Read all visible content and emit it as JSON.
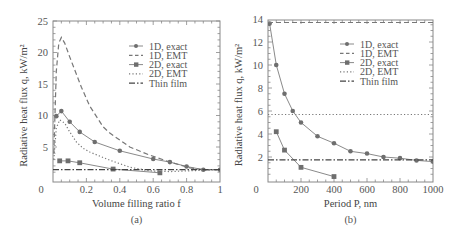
{
  "chart_data": [
    {
      "type": "line",
      "panel": "(a)",
      "title": "",
      "xlabel": "Volume filling ratio f",
      "ylabel": "Radiative heat flux q, kW/m²",
      "xlim": [
        0,
        1
      ],
      "ylim": [
        0,
        25
      ],
      "xticks": [
        0,
        0.2,
        0.4,
        0.6,
        0.8,
        1
      ],
      "xtick_labels": [
        "0",
        "0.2",
        "0.4",
        "0.6",
        "0.8",
        "1"
      ],
      "yticks": [
        5,
        10,
        15,
        20,
        25
      ],
      "ytick_labels": [
        "5",
        "10",
        "15",
        "20",
        "25"
      ],
      "grid": false,
      "legend_position": "upper right",
      "series": [
        {
          "name": "1D, exact",
          "style": "solid-circle",
          "x": [
            0.02,
            0.05,
            0.1,
            0.16,
            0.25,
            0.4,
            0.6,
            0.7,
            0.8,
            0.9,
            1.0
          ],
          "y": [
            9.9,
            10.7,
            9.0,
            7.4,
            5.8,
            4.4,
            3.1,
            2.6,
            1.9,
            1.4,
            1.4
          ]
        },
        {
          "name": "1D, EMT",
          "style": "dashed",
          "x": [
            0.005,
            0.02,
            0.035,
            0.05,
            0.07,
            0.1,
            0.17,
            0.22,
            0.3,
            0.34,
            0.46,
            0.58,
            0.7,
            0.82,
            0.9,
            1.0
          ],
          "y": [
            4,
            17,
            21.5,
            22.4,
            21.5,
            19.3,
            14.5,
            11.5,
            8.2,
            7.2,
            5.0,
            3.7,
            2.6,
            1.7,
            1.4,
            1.4
          ]
        },
        {
          "name": "2D, exact",
          "style": "solid-square",
          "x": [
            0.04,
            0.09,
            0.16,
            0.36,
            0.64
          ],
          "y": [
            2.8,
            2.8,
            2.5,
            1.5,
            0.9
          ]
        },
        {
          "name": "2D, EMT",
          "style": "dotted",
          "x": [
            0.005,
            0.02,
            0.04,
            0.07,
            0.1,
            0.14,
            0.18,
            0.22,
            0.34,
            0.46,
            0.58,
            0.7,
            0.8,
            0.9,
            1.0
          ],
          "y": [
            3,
            8,
            9.3,
            8.8,
            7.4,
            5.8,
            4.8,
            4.2,
            2.9,
            1.8,
            1.2,
            1.1,
            1.2,
            1.3,
            1.4
          ]
        },
        {
          "name": "Thin film",
          "style": "dash-dot",
          "x": [
            0,
            1
          ],
          "y": [
            1.4,
            1.4
          ]
        }
      ]
    },
    {
      "type": "line",
      "panel": "(b)",
      "title": "",
      "xlabel": "Period P, nm",
      "ylabel": "Radiative heat flux q, kW/m²",
      "xlim": [
        0,
        1000
      ],
      "ylim": [
        0,
        14
      ],
      "xticks": [
        0,
        200,
        400,
        600,
        800,
        1000
      ],
      "xtick_labels": [
        "0",
        "200",
        "400",
        "600",
        "800",
        "1000"
      ],
      "yticks": [
        2,
        4,
        6,
        8,
        10,
        12,
        14
      ],
      "ytick_labels": [
        "2",
        "4",
        "6",
        "8",
        "10",
        "12",
        "14"
      ],
      "grid": false,
      "legend_position": "upper right",
      "series": [
        {
          "name": "1D, exact",
          "style": "solid-circle",
          "x": [
            10,
            50,
            100,
            150,
            200,
            300,
            400,
            500,
            600,
            700,
            800,
            900,
            1000
          ],
          "y": [
            13.6,
            10.0,
            7.5,
            6.0,
            5.0,
            3.8,
            3.2,
            2.5,
            2.3,
            2.0,
            1.9,
            1.7,
            1.6
          ]
        },
        {
          "name": "1D, EMT",
          "style": "dashed",
          "x": [
            0,
            1000
          ],
          "y": [
            13.7,
            13.7
          ]
        },
        {
          "name": "2D, exact",
          "style": "solid-square",
          "x": [
            50,
            100,
            200,
            400
          ],
          "y": [
            4.2,
            2.6,
            1.1,
            0.3
          ]
        },
        {
          "name": "2D, EMT",
          "style": "dotted",
          "x": [
            0,
            1000
          ],
          "y": [
            5.7,
            5.7
          ]
        },
        {
          "name": "Thin film",
          "style": "dash-dot",
          "x": [
            0,
            1000
          ],
          "y": [
            1.75,
            1.75
          ]
        }
      ]
    }
  ],
  "colors": {
    "exact_line": "#8a8a8a",
    "marker": "#6e6e6e",
    "emt_line": "#777777",
    "thin_film": "#444444",
    "axis": "#888888",
    "text": "#555555"
  }
}
